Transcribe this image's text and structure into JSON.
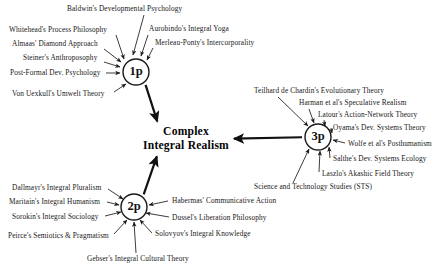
{
  "diagram": {
    "center": {
      "line1": "Complex",
      "line2": "Integral Realism",
      "x": 186,
      "y": 139
    },
    "ink_color": "#161616",
    "background_color": "#ffffff",
    "nodes": [
      {
        "id": "1p",
        "label": "1p",
        "x": 136,
        "y": 72,
        "r": 13
      },
      {
        "id": "2p",
        "label": "2p",
        "x": 134,
        "y": 207,
        "r": 13
      },
      {
        "id": "3p",
        "label": "3p",
        "x": 318,
        "y": 137,
        "r": 13
      }
    ],
    "main_arrows": [
      {
        "from": "1p",
        "to": "center",
        "label": "arrow-1p-to-center"
      },
      {
        "from": "2p",
        "to": "center",
        "label": "arrow-2p-to-center"
      },
      {
        "from": "3p",
        "to": "center",
        "label": "arrow-3p-to-center"
      }
    ],
    "groups": [
      {
        "node": "1p",
        "name": "first-person-group",
        "items": [
          {
            "text": "Baldwin's Developmental Psychology",
            "tx": 67,
            "ty": 11,
            "anchor": "start",
            "lx": 144,
            "ly": 15,
            "ax": 133,
            "ay": 55
          },
          {
            "text": "Whitehead's Process Philosophy",
            "tx": 9,
            "ty": 32,
            "anchor": "start",
            "lx": 116,
            "ly": 35,
            "ax": 124,
            "ay": 59
          },
          {
            "text": "Aurobindo's Integral Yoga",
            "tx": 149,
            "ty": 31,
            "anchor": "start",
            "lx": 148,
            "ly": 35,
            "ax": 141,
            "ay": 56
          },
          {
            "text": "Almaas' Diamond Approach",
            "tx": 12,
            "ty": 46,
            "anchor": "start",
            "lx": 104,
            "ly": 49,
            "ax": 121,
            "ay": 62
          },
          {
            "text": "Merleau-Ponty's Intercorporality",
            "tx": 155,
            "ty": 45,
            "anchor": "start",
            "lx": 153,
            "ly": 48,
            "ax": 147,
            "ay": 60
          },
          {
            "text": "Steiner's Anthroposophy",
            "tx": 23,
            "ty": 60,
            "anchor": "start",
            "lx": 104,
            "ly": 62,
            "ax": 120,
            "ay": 67
          },
          {
            "text": "Post-Formal Dev. Psychology",
            "tx": 10,
            "ty": 75,
            "anchor": "start",
            "lx": 106,
            "ly": 73,
            "ax": 120,
            "ay": 73
          },
          {
            "text": "Von Uexkull's Umwelt Theory",
            "tx": 12,
            "ty": 96,
            "anchor": "start",
            "lx": 114,
            "ly": 92,
            "ax": 126,
            "ay": 84
          }
        ]
      },
      {
        "node": "2p",
        "name": "second-person-group",
        "items": [
          {
            "text": "Dallmayr's Integral Pluralism",
            "tx": 12,
            "ty": 190,
            "anchor": "start",
            "lx": 108,
            "ly": 189,
            "ax": 123,
            "ay": 199
          },
          {
            "text": "Maritain's Integral Humanism",
            "tx": 9,
            "ty": 204,
            "anchor": "start",
            "lx": 107,
            "ly": 202,
            "ax": 119,
            "ay": 205
          },
          {
            "text": "Habermas' Communicative Action",
            "tx": 172,
            "ty": 203,
            "anchor": "start",
            "lx": 168,
            "ly": 201,
            "ax": 149,
            "ay": 205
          },
          {
            "text": "Sorokin's Integral Sociology",
            "tx": 12,
            "ty": 219,
            "anchor": "start",
            "lx": 105,
            "ly": 216,
            "ax": 121,
            "ay": 212
          },
          {
            "text": "Dussel's Liberation Philosophy",
            "tx": 172,
            "ty": 220,
            "anchor": "start",
            "lx": 169,
            "ly": 217,
            "ax": 146,
            "ay": 213
          },
          {
            "text": "Peirce's Semiotics & Pragmatism",
            "tx": 8,
            "ty": 238,
            "anchor": "start",
            "lx": 114,
            "ly": 234,
            "ax": 127,
            "ay": 220
          },
          {
            "text": "Solovyov's Integral Knowledge",
            "tx": 155,
            "ty": 236,
            "anchor": "start",
            "lx": 152,
            "ly": 233,
            "ax": 140,
            "ay": 220
          },
          {
            "text": "Gebser's Integral Cultural Theory",
            "tx": 87,
            "ty": 261,
            "anchor": "start",
            "lx": 136,
            "ly": 253,
            "ax": 134,
            "ay": 222
          }
        ]
      },
      {
        "node": "3p",
        "name": "third-person-group",
        "items": [
          {
            "text": "Teilhard de Chardin's Evolutionary Theory",
            "tx": 254,
            "ty": 93,
            "anchor": "start",
            "lx": 278,
            "ly": 97,
            "ax": 308,
            "ay": 126
          },
          {
            "text": "Harman et al's Speculative Realism",
            "tx": 299,
            "ty": 105,
            "anchor": "start",
            "lx": 309,
            "ly": 109,
            "ax": 314,
            "ay": 123
          },
          {
            "text": "Latour's Action-Network Theory",
            "tx": 318,
            "ty": 117,
            "anchor": "start",
            "lx": 324,
            "ly": 120,
            "ax": 325,
            "ay": 126
          },
          {
            "text": "Oyama's Dev. Systems Theory",
            "tx": 333,
            "ty": 130,
            "anchor": "start",
            "lx": 331,
            "ly": 128,
            "ax": 332,
            "ay": 133
          },
          {
            "text": "Wolfe et al's Posthumanism",
            "tx": 348,
            "ty": 146,
            "anchor": "start",
            "lx": 345,
            "ly": 143,
            "ax": 333,
            "ay": 140
          },
          {
            "text": "Salthe's Dev. Systems Ecology",
            "tx": 333,
            "ty": 161,
            "anchor": "start",
            "lx": 330,
            "ly": 158,
            "ax": 329,
            "ay": 147
          },
          {
            "text": "Laszlo's Akashic Field Theory",
            "tx": 322,
            "ty": 176,
            "anchor": "start",
            "lx": 319,
            "ly": 172,
            "ax": 320,
            "ay": 151
          },
          {
            "text": "Science and Technology Studies (STS)",
            "tx": 254,
            "ty": 189,
            "anchor": "start",
            "lx": 293,
            "ly": 183,
            "ax": 309,
            "ay": 149
          }
        ]
      }
    ]
  }
}
